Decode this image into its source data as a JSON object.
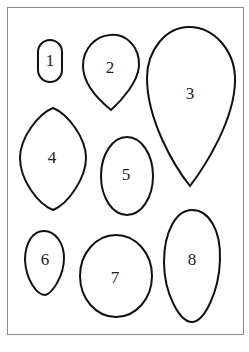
{
  "figure": {
    "frame_color": "#8a8a8a",
    "stroke_color": "#111111",
    "shapes": [
      {
        "label": "1",
        "type": "small-rounded-oval"
      },
      {
        "label": "2",
        "type": "inverted-teardrop"
      },
      {
        "label": "3",
        "type": "large-inverted-teardrop"
      },
      {
        "label": "4",
        "type": "lemon-shape"
      },
      {
        "label": "5",
        "type": "oval"
      },
      {
        "label": "6",
        "type": "small-egg"
      },
      {
        "label": "7",
        "type": "circle"
      },
      {
        "label": "8",
        "type": "tall-egg"
      }
    ]
  }
}
